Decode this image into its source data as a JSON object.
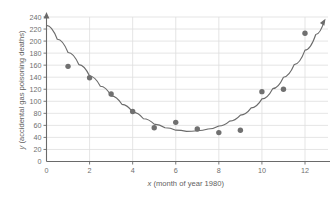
{
  "chart_data": {
    "type": "scatter",
    "title": "",
    "subtitle": "",
    "xlabel": "x (month of year 1980)",
    "ylabel": "y (accidental gas poisoning deaths)",
    "xlabel_var": "x",
    "xlabel_rest": " (month of year 1980)",
    "ylabel_var": "y",
    "ylabel_rest": " (accidental gas poisoning deaths)",
    "xlim": [
      0,
      13
    ],
    "ylim": [
      0,
      245
    ],
    "xticks": [
      0,
      2,
      4,
      6,
      8,
      10,
      12
    ],
    "xtick_labels": [
      "0",
      "2",
      "4",
      "6",
      "8",
      "10",
      "12"
    ],
    "yticks": [
      0,
      20,
      40,
      60,
      80,
      100,
      120,
      140,
      160,
      180,
      200,
      220,
      240
    ],
    "ytick_labels": [
      "0",
      "20",
      "40",
      "60",
      "80",
      "100",
      "120",
      "140",
      "160",
      "180",
      "200",
      "220",
      "240"
    ],
    "grid": true,
    "grid_x": [
      2,
      4,
      6,
      8,
      10,
      12
    ],
    "grid_y": [
      20,
      40,
      60,
      80,
      100,
      120,
      140,
      160,
      180,
      200,
      220,
      240
    ],
    "legend": "none",
    "x": [
      0,
      1,
      2,
      3,
      4,
      5,
      6,
      7,
      8,
      9,
      10,
      11,
      12
    ],
    "values": [
      226,
      158,
      139,
      112,
      83,
      56,
      65,
      54,
      48,
      52,
      116,
      120,
      213
    ],
    "series": [
      {
        "name": "accidental gas poisoning deaths",
        "marker": "circle",
        "color": "#707070",
        "values": [
          226,
          158,
          139,
          112,
          83,
          56,
          65,
          54,
          48,
          52,
          116,
          120,
          213
        ]
      }
    ],
    "fit_curve": {
      "name": "quadratic fit",
      "type": "parabola",
      "color": "#6b6b6b",
      "vertex_x": 6.4,
      "vertex_y": 50,
      "y_at_x0": 226,
      "points": [
        [
          0,
          226
        ],
        [
          0.5,
          203
        ],
        [
          1,
          181
        ],
        [
          1.5,
          161
        ],
        [
          2,
          142
        ],
        [
          2.5,
          125
        ],
        [
          3,
          109
        ],
        [
          3.5,
          95
        ],
        [
          4,
          82
        ],
        [
          4.5,
          71
        ],
        [
          5,
          62
        ],
        [
          5.5,
          56
        ],
        [
          6,
          52
        ],
        [
          6.5,
          50
        ],
        [
          7,
          51
        ],
        [
          7.5,
          54
        ],
        [
          8,
          59
        ],
        [
          8.5,
          67
        ],
        [
          9,
          77
        ],
        [
          9.5,
          89
        ],
        [
          10,
          104
        ],
        [
          10.5,
          121
        ],
        [
          11,
          140
        ],
        [
          11.5,
          161
        ],
        [
          12,
          185
        ],
        [
          12.5,
          211
        ],
        [
          12.9,
          234
        ]
      ],
      "arrow_end": true
    },
    "axis_arrows": {
      "y_axis_top_arrow": true,
      "x_axis_right_arrow": false
    },
    "colors": {
      "marker": "#707070",
      "curve": "#6b6b6b",
      "axis": "#6a6a6a",
      "grid": "#dedede",
      "text": "#6f6f6f",
      "background": "#ffffff"
    }
  }
}
